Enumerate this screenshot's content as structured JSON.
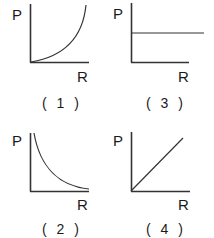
{
  "figure": {
    "axis_y_label": "P",
    "axis_x_label": "R",
    "panels": [
      {
        "id": "1",
        "caption": "( 1 )",
        "shape": "increasing-convex-curve",
        "description": "P increases exponentially/steeply with R"
      },
      {
        "id": "3",
        "caption": "( 3 )",
        "shape": "horizontal-line",
        "description": "P constant independent of R"
      },
      {
        "id": "2",
        "caption": "( 2 )",
        "shape": "decreasing-hyperbola",
        "description": "P decreases with R (inverse relation)"
      },
      {
        "id": "4",
        "caption": "( 4 )",
        "shape": "straight-line-through-origin",
        "description": "P directly proportional to R"
      }
    ]
  },
  "colors": {
    "ink": "#333333",
    "background": "#ffffff"
  }
}
